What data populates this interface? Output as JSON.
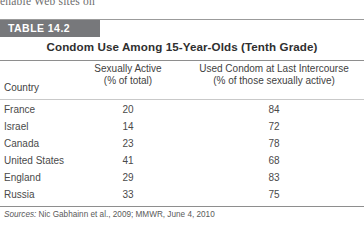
{
  "page_bleed_text": "enable Web sites on",
  "table": {
    "badge": "TABLE 14.2",
    "title": "Condom Use Among 15-Year-Olds (Tenth Grade)",
    "headers": {
      "country": "Country",
      "col2_line1": "Sexually Active",
      "col2_line2": "(% of total)",
      "col3_line1": "Used Condom at Last Intercourse",
      "col3_line2": "(% of those sexually active)"
    },
    "rows": [
      {
        "country": "France",
        "sexually_active": "20",
        "used_condom": "84"
      },
      {
        "country": "Israel",
        "sexually_active": "14",
        "used_condom": "72"
      },
      {
        "country": "Canada",
        "sexually_active": "23",
        "used_condom": "78"
      },
      {
        "country": "United States",
        "sexually_active": "41",
        "used_condom": "68"
      },
      {
        "country": "England",
        "sexually_active": "29",
        "used_condom": "83"
      },
      {
        "country": "Russia",
        "sexually_active": "33",
        "used_condom": "75"
      }
    ],
    "sources_label": "Sources:",
    "sources_text": "Nic Gabhainn et al., 2009; MMWR, June 4, 2010"
  },
  "chart_data": {
    "type": "table",
    "title": "Condom Use Among 15-Year-Olds (Tenth Grade)",
    "categories": [
      "France",
      "Israel",
      "Canada",
      "United States",
      "England",
      "Russia"
    ],
    "columns": [
      "Country",
      "Sexually Active (% of total)",
      "Used Condom at Last Intercourse (% of those sexually active)"
    ],
    "series": [
      {
        "name": "Sexually Active (% of total)",
        "values": [
          20,
          14,
          23,
          41,
          29,
          33
        ]
      },
      {
        "name": "Used Condom at Last Intercourse (% of those sexually active)",
        "values": [
          84,
          72,
          78,
          68,
          83,
          75
        ]
      }
    ],
    "xlabel": "Country",
    "ylabel": "Percent",
    "ylim": [
      0,
      100
    ],
    "grid": false,
    "legend": "none",
    "annotations": [
      "Sources: Nic Gabhainn et al., 2009; MMWR, June 4, 2010"
    ]
  },
  "colors": {
    "badge_background": "#77787b",
    "badge_text": "#ffffff",
    "rule": "#8e8e8e",
    "text": "#4a4a4a"
  }
}
